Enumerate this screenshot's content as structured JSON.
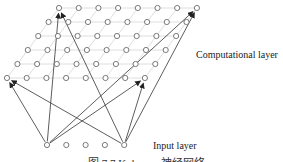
{
  "diagram": {
    "computational_layer_label": "Computational layer",
    "input_layer_label": "Input layer",
    "caption": "图 7.7  Kohonen 神经网络",
    "grid": {
      "rows": 6,
      "cols": 8
    },
    "input_nodes": 5,
    "connections": [
      {
        "from": "input-1",
        "to": "grid-r6-c1"
      },
      {
        "from": "input-1",
        "to": "grid-r1-c1"
      },
      {
        "from": "input-1",
        "to": "grid-r1-c8"
      },
      {
        "from": "input-1",
        "to": "grid-r6-c8"
      },
      {
        "from": "input-5",
        "to": "grid-r6-c1"
      },
      {
        "from": "input-5",
        "to": "grid-r1-c1"
      },
      {
        "from": "input-5",
        "to": "grid-r1-c8"
      },
      {
        "from": "input-5",
        "to": "grid-r6-c8"
      }
    ],
    "colors": {
      "node_stroke": "#6b6b6b",
      "grid_line": "#d6d6d6",
      "arrow": "#333333"
    }
  }
}
